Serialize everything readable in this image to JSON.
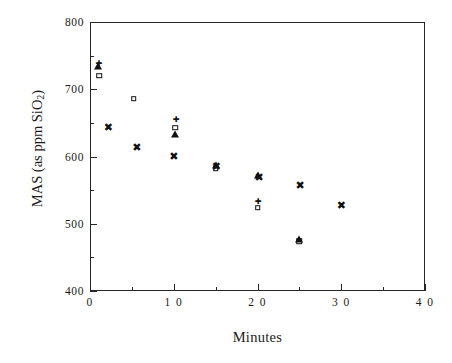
{
  "chart_data": {
    "type": "scatter",
    "title": "",
    "xlabel": "Minutes",
    "ylabel": "MAS (as ppm SiO2)",
    "ylabel_parts": {
      "prefix": "MAS (as ppm SiO",
      "sub": "2",
      "suffix": ")"
    },
    "xlim": [
      0,
      40
    ],
    "ylim": [
      400,
      800
    ],
    "grid": false,
    "legend": "none",
    "x_major_ticks": [
      0,
      10,
      20,
      30,
      40
    ],
    "x_minor_ticks": [
      5,
      15,
      25,
      35
    ],
    "y_major_ticks": [
      400,
      500,
      600,
      700,
      800
    ],
    "y_minor_ticks": [
      450,
      550,
      650,
      750
    ],
    "x_tick_labels": [
      "0",
      "1 0",
      "2 0",
      "3 0",
      "4 0"
    ],
    "y_tick_labels": [
      "400",
      "500",
      "600",
      "700",
      "800"
    ],
    "series": [
      {
        "name": "open-square",
        "marker": "square",
        "points": [
          {
            "x": 1.1,
            "y": 720
          },
          {
            "x": 5.2,
            "y": 686
          },
          {
            "x": 10.2,
            "y": 643
          },
          {
            "x": 15.0,
            "y": 583
          },
          {
            "x": 20.0,
            "y": 524
          },
          {
            "x": 25.0,
            "y": 474
          }
        ]
      },
      {
        "name": "filled-triangle",
        "marker": "triangle",
        "points": [
          {
            "x": 1.0,
            "y": 734
          },
          {
            "x": 10.1,
            "y": 633
          },
          {
            "x": 15.0,
            "y": 588
          },
          {
            "x": 20.1,
            "y": 572
          },
          {
            "x": 25.0,
            "y": 477
          }
        ]
      },
      {
        "name": "cross",
        "marker": "cross",
        "points": [
          {
            "x": 2.2,
            "y": 643
          },
          {
            "x": 5.6,
            "y": 613
          },
          {
            "x": 10.0,
            "y": 600
          },
          {
            "x": 15.1,
            "y": 584
          },
          {
            "x": 20.2,
            "y": 568
          },
          {
            "x": 25.1,
            "y": 556
          },
          {
            "x": 30.0,
            "y": 527
          }
        ]
      },
      {
        "name": "small-plus",
        "marker": "plus",
        "points": [
          {
            "x": 1.1,
            "y": 737
          },
          {
            "x": 10.3,
            "y": 655
          },
          {
            "x": 20.1,
            "y": 533
          }
        ]
      }
    ]
  }
}
